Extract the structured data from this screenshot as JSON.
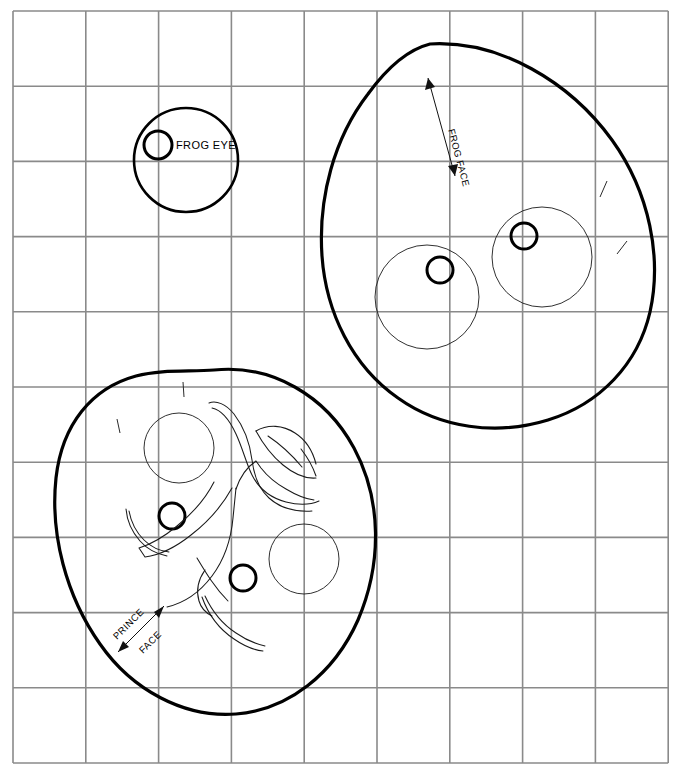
{
  "page": {
    "background_color": "#ffffff",
    "width": 689,
    "height": 777
  },
  "grid": {
    "name": "construction-grid",
    "color": "#8a8a8a",
    "origin_x": 13,
    "origin_y": 11,
    "columns": 9,
    "rows": 10,
    "cell_width": 72.8,
    "cell_height": 75.2
  },
  "labels": {
    "frog_eye": "FROG EYE",
    "frog_face": "FROG FACE",
    "prince_word": "PRINCE",
    "face_word": "FACE"
  },
  "colors": {
    "outline": "#000000",
    "thin_line": "#1a1a1a",
    "grid": "#8a8a8a",
    "background": "#ffffff"
  },
  "figures": {
    "frog_eye_detail": {
      "name": "frog-eye-detail",
      "big_circle": {
        "cx": 186,
        "cy": 160,
        "r": 52
      },
      "pupil": {
        "cx": 158,
        "cy": 145,
        "r": 14
      },
      "label_x": 176,
      "label_y": 149
    },
    "frog_face": {
      "name": "frog-face",
      "sockets": [
        {
          "cx": 427,
          "cy": 297,
          "r": 52
        },
        {
          "cx": 542,
          "cy": 257,
          "r": 50
        }
      ],
      "pupils": [
        {
          "cx": 440,
          "cy": 270,
          "r": 13
        },
        {
          "cx": 524,
          "cy": 236,
          "r": 13
        }
      ],
      "dimension": {
        "x1": 428,
        "y1": 78,
        "x2": 455,
        "y2": 176,
        "text_x": 448,
        "text_y": 130,
        "text_rotation": 75
      }
    },
    "prince_face": {
      "name": "prince-face",
      "sockets": [
        {
          "cx": 179,
          "cy": 448,
          "r": 35
        },
        {
          "cx": 304,
          "cy": 559,
          "r": 35
        }
      ],
      "pupils": [
        {
          "cx": 172,
          "cy": 516,
          "r": 13
        },
        {
          "cx": 243,
          "cy": 578,
          "r": 13
        }
      ],
      "dimension": {
        "x1": 118,
        "y1": 652,
        "x2": 164,
        "y2": 606,
        "prince_x": 128,
        "prince_y": 638,
        "prince_rotation": -45,
        "face_x": 152,
        "face_y": 648,
        "face_rotation": -45
      }
    }
  }
}
